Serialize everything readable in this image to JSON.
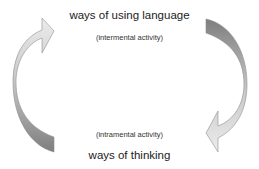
{
  "diagram": {
    "top": {
      "title": "ways of using language",
      "subtitle": "(intermental activity)"
    },
    "bottom": {
      "subtitle": "(intramental activity)",
      "title": "ways of thinking"
    },
    "arrows": [
      {
        "name": "left-curved-arrow",
        "direction": "upward",
        "from": "ways of thinking",
        "to": "ways of using language"
      },
      {
        "name": "right-curved-arrow",
        "direction": "downward",
        "from": "ways of using language",
        "to": "ways of thinking"
      }
    ],
    "colors": {
      "dark": "#8a8a8a",
      "light": "#e6e6e6",
      "stroke": "#8f8f8f"
    }
  }
}
